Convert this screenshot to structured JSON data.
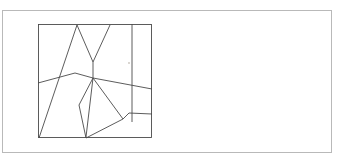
{
  "figure": {
    "background_color": "#ffffff",
    "stroke_color": "#4a4a4a",
    "frame_color": "#b9b9b9",
    "canvas": {
      "width": 351,
      "height": 164
    },
    "outer_frame": {
      "name": "outer-border",
      "x": 2,
      "y": 10,
      "width": 330,
      "height": 143,
      "stroke": "#b9b9b9"
    },
    "inner_frame": {
      "name": "drawing-square",
      "x": 38,
      "y": 24,
      "width": 114,
      "height": 114,
      "stroke": "#4a4a4a"
    },
    "vertices": {
      "box_top_left": [
        38,
        24
      ],
      "box_top_right": [
        152,
        24
      ],
      "box_bottom_left": [
        38,
        138
      ],
      "box_bottom_right": [
        152,
        138
      ],
      "apex_left": [
        77,
        25
      ],
      "apex_right": [
        110,
        25
      ],
      "v_bottom": [
        93,
        62
      ],
      "hub": [
        93,
        78
      ],
      "ridge_peak": [
        75,
        73
      ],
      "left_edge_mid": [
        38,
        83
      ],
      "right_edge_mid": [
        152,
        89
      ],
      "vertical_top": [
        132,
        24
      ],
      "vertical_bottom": [
        132,
        122
      ],
      "notch_left": [
        123,
        119
      ],
      "notch_top": [
        129,
        113
      ],
      "right_edge_step": [
        152,
        114
      ],
      "lower_left_node": [
        79,
        105
      ],
      "bottom_node": [
        86,
        138
      ],
      "polygon_right": [
        120,
        113
      ]
    },
    "paths": [
      {
        "name": "v-chevron",
        "points": "77,25 93,62 110,25",
        "description": "tall narrow chevron rising to the top edge"
      },
      {
        "name": "long-diagonal-left",
        "points": "77,25 39,138",
        "description": "long diagonal from upper apex to bottom-left corner"
      },
      {
        "name": "ridge-line",
        "points": "38,83 75,73 93,78 152,89",
        "description": "gently bent near-horizontal ridge spanning the square"
      },
      {
        "name": "hub-to-bottom-node",
        "points": "93,62 93,78 86,138",
        "description": "vertical-ish spine from chevron base through hub to bottom edge"
      },
      {
        "name": "hub-to-notch",
        "points": "93,78 123,119",
        "description": "diagonal from hub down-right to the notch vertex"
      },
      {
        "name": "lower-polygon",
        "points": "79,105 93,78",
        "description": "short edge rising from lower-left node to hub"
      },
      {
        "name": "lower-polygon-base",
        "points": "79,105 86,138 123,119",
        "description": "base of the lower irregular polygon"
      },
      {
        "name": "notch-step",
        "points": "123,119 129,113 152,114",
        "description": "small step notch leading to the right edge"
      }
    ],
    "marks": [
      {
        "name": "faint-speck",
        "x": 129,
        "y": 63,
        "radius": 0.9,
        "color": "#c9c4bd"
      }
    ]
  }
}
